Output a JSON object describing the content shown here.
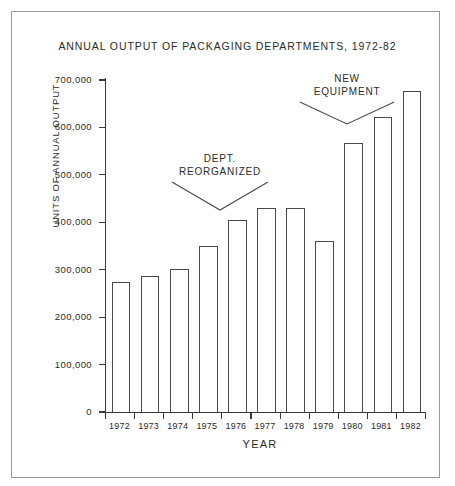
{
  "chart_data": {
    "type": "bar",
    "title": "ANNUAL OUTPUT OF PACKAGING DEPARTMENTS, 1972-82",
    "xlabel": "YEAR",
    "ylabel": "UNITS OF ANNUAL OUTPUT",
    "categories": [
      "1972",
      "1973",
      "1974",
      "1975",
      "1976",
      "1977",
      "1978",
      "1979",
      "1980",
      "1981",
      "1982"
    ],
    "values": [
      274000,
      287000,
      302000,
      350000,
      405000,
      430000,
      430000,
      360000,
      568000,
      622000,
      676000
    ],
    "ylim": [
      0,
      700000
    ],
    "ytick_labels": [
      "0",
      "100,000",
      "200,000",
      "300,000",
      "400,000",
      "500,000",
      "600,000",
      "700,000"
    ],
    "ytick_values": [
      0,
      100000,
      200000,
      300000,
      400000,
      500000,
      600000,
      700000
    ],
    "grid": false,
    "legend": null,
    "bar_fill_color": "#ffffff",
    "bar_edge_color": "#4a4a4a",
    "annotations": [
      {
        "text_line1": "DEPT.",
        "text_line2": "REORGANIZED",
        "points_to_category": "1975"
      },
      {
        "text_line1": "NEW",
        "text_line2": "EQUIPMENT",
        "points_to_category": "1980"
      }
    ]
  }
}
